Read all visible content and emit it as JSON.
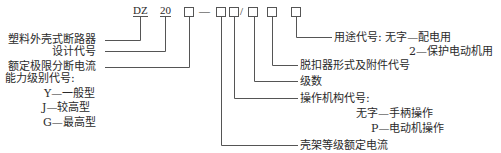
{
  "model_code": {
    "prefix": "DZ",
    "design_number": "20",
    "dash": "—",
    "slash": "/"
  },
  "labels": {
    "breaker_type": "塑料外壳式断路器",
    "design_code": "设计代号",
    "rated_breaking_current": "额定极限分断电流",
    "capacity_level": {
      "title": "能力级别代号:",
      "options": [
        "Y—一般型",
        "J—较高型",
        "G—最高型"
      ]
    },
    "purpose_code": {
      "title": "用途代号: 无字—配电用",
      "option2": "2—保护电动机用"
    },
    "release_type": "脱扣器形式及附件代号",
    "poles": "级数",
    "operating_mechanism": {
      "title": "操作机构代号:",
      "options": [
        "无字—手柄操作",
        "P—电动机操作"
      ]
    },
    "frame_rated_current": "壳架等级额定电流"
  }
}
